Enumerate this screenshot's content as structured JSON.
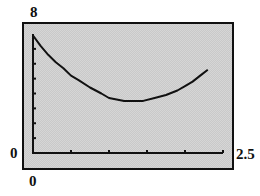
{
  "chart_data": {
    "type": "line",
    "title": "",
    "xlabel": "",
    "ylabel": "",
    "xlim": [
      0,
      2.5
    ],
    "ylim": [
      0,
      8
    ],
    "xscale_ticks": 0.5,
    "yscale_ticks": 1,
    "grid": false,
    "legend": null,
    "x": [
      0.0,
      0.1,
      0.2,
      0.3,
      0.4,
      0.5,
      0.6,
      0.75,
      0.9,
      1.0,
      1.1,
      1.2,
      1.3,
      1.45,
      1.6,
      1.75,
      1.9,
      2.0,
      2.1,
      2.2,
      2.3
    ],
    "series": [
      {
        "name": "y",
        "values": [
          7.9,
          7.2,
          6.6,
          6.1,
          5.7,
          5.2,
          4.9,
          4.4,
          4.0,
          3.7,
          3.6,
          3.5,
          3.5,
          3.5,
          3.7,
          3.9,
          4.2,
          4.5,
          4.8,
          5.2,
          5.6
        ]
      }
    ],
    "window_labels": {
      "ymax": "8",
      "ymin": "0",
      "xmin": "0",
      "xmax": "2.5"
    }
  },
  "labels": {
    "ymax": "8",
    "ymin": "0",
    "xmin": "0",
    "xmax": "2.5"
  },
  "colors": {
    "screen_bg": "#d6d6d6",
    "ink": "#111111"
  }
}
